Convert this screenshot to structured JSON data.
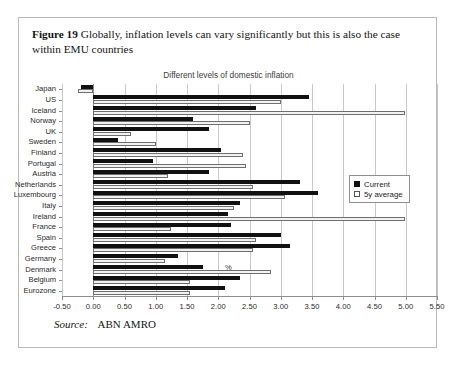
{
  "figure": {
    "label": "Figure 19",
    "caption": "Globally, inflation levels can vary significantly but this is also the case within EMU countries"
  },
  "source": {
    "label": "Source:",
    "value": "ABN AMRO"
  },
  "legend": {
    "position": "right-middle",
    "entries": [
      "Current",
      "5y average"
    ]
  },
  "colors": {
    "current": "#111111",
    "average": "#f2f2f2",
    "average_border": "#6e6e6e",
    "grid": "#c8c8c8",
    "axis": "#8e8e8e",
    "card_border": "#b9b9b9"
  },
  "chart_data": {
    "type": "bar",
    "orientation": "horizontal",
    "title": "Different levels of domestic inflation",
    "xlabel": "%",
    "ylabel": "",
    "xlim": [
      -0.5,
      5.5
    ],
    "xticks": [
      -0.5,
      0.0,
      0.5,
      1.0,
      1.5,
      2.0,
      2.5,
      3.0,
      3.5,
      4.0,
      4.5,
      5.0,
      5.5
    ],
    "xticklabels": [
      "-0.50",
      "0.00",
      "0.50",
      "1.00",
      "1.50",
      "2.00",
      "2.50",
      "3.00",
      "3.50",
      "4.00",
      "4.50",
      "5.00",
      "5.50"
    ],
    "grid": true,
    "categories": [
      "Japan",
      "US",
      "Iceland",
      "Norway",
      "UK",
      "Sweden",
      "Finland",
      "Portugal",
      "Austria",
      "Netherlands",
      "Luxembourg",
      "Italy",
      "Ireland",
      "France",
      "Spain",
      "Greece",
      "Germany",
      "Denmark",
      "Belgium",
      "Eurozone"
    ],
    "series": [
      {
        "name": "Current",
        "color": "#111111",
        "values": [
          -0.2,
          3.45,
          2.6,
          1.6,
          1.85,
          0.4,
          2.05,
          0.95,
          1.85,
          3.3,
          3.6,
          2.35,
          2.15,
          2.2,
          3.0,
          3.15,
          1.35,
          1.75,
          2.35,
          2.1
        ]
      },
      {
        "name": "5y average",
        "color": "#f2f2f2",
        "values": [
          -0.25,
          3.0,
          4.98,
          2.5,
          0.6,
          1.0,
          2.4,
          2.45,
          1.2,
          2.55,
          3.07,
          2.25,
          4.98,
          1.25,
          2.6,
          2.55,
          1.15,
          2.85,
          1.55,
          1.55
        ]
      }
    ]
  }
}
